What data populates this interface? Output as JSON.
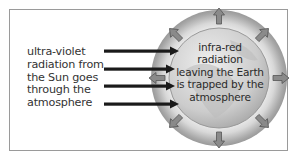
{
  "diagram": {
    "left_label_lines": [
      "ultra-violet",
      "radiation from",
      "the Sun goes",
      "through the",
      "atmosphere"
    ],
    "earth_label_lines": [
      "infra-red",
      "radiation",
      "leaving the Earth",
      "is trapped by the",
      "atmosphere"
    ],
    "incoming_arrows": 4,
    "outgoing_arrows": 8,
    "colors": {
      "frame": "#9a9a9a",
      "incoming_arrow": "#1a1a1a",
      "outgoing_arrow": "#7a7a7a",
      "earth": "#cfcfcf",
      "atmosphere": "#e0e0e0"
    }
  }
}
